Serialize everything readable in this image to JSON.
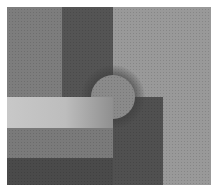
{
  "image": {
    "description": "Grayscale noisy abstract composition of overlapping rectangles and a circle",
    "colors": {
      "background": "#ffffff",
      "left_panel": "#7d7d7d",
      "dark_vertical_bar": "#545454",
      "right_panel": "#999999",
      "bright_bar": "#c2c2c2",
      "mid_bar": "#7a7a7a",
      "bottom_band": "#4a4a4a",
      "dark_square": "#505050",
      "circle": "#8a8a8a"
    }
  }
}
